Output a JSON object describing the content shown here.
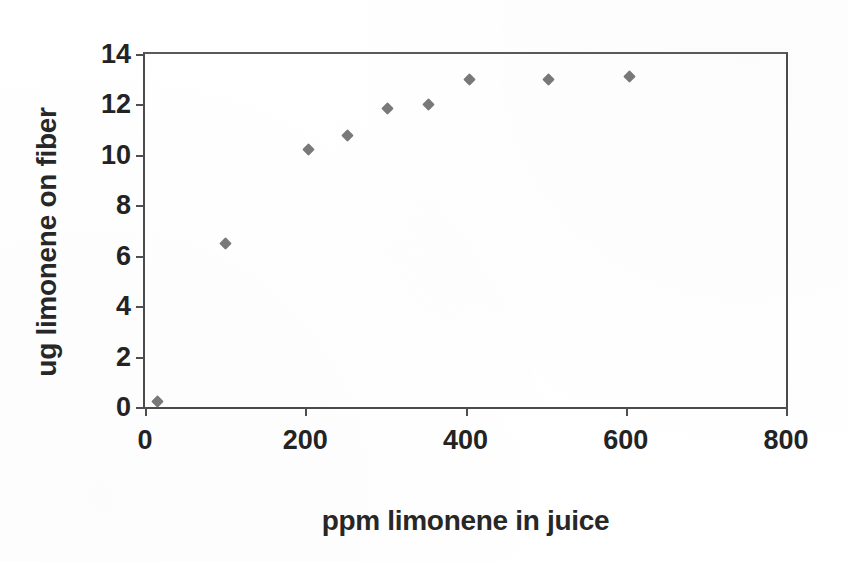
{
  "chart_data": {
    "type": "scatter",
    "title": "",
    "subtitle": "",
    "xlabel": "ppm limonene in juice",
    "ylabel": "ug limonene on fiber",
    "xlim": [
      0,
      800
    ],
    "ylim": [
      0,
      14
    ],
    "xticks": [
      "0",
      "200",
      "400",
      "600",
      "800"
    ],
    "xtick_values": [
      0,
      200,
      400,
      600,
      800
    ],
    "yticks": [
      "0",
      "2",
      "4",
      "6",
      "8",
      "10",
      "12",
      "14"
    ],
    "ytick_values": [
      0,
      2,
      4,
      6,
      8,
      10,
      12,
      14
    ],
    "grid": false,
    "legend": null,
    "legend_position": "none",
    "marker": {
      "shape": "diamond",
      "color": "#6e6e6e",
      "size_px": 9
    },
    "frame": "box",
    "series": [
      {
        "name": "limonene uptake",
        "points": [
          {
            "x": 15,
            "y": 0.2
          },
          {
            "x": 100,
            "y": 6.5
          },
          {
            "x": 204,
            "y": 10.2
          },
          {
            "x": 253,
            "y": 10.75
          },
          {
            "x": 303,
            "y": 11.85
          },
          {
            "x": 354,
            "y": 12.0
          },
          {
            "x": 405,
            "y": 13.0
          },
          {
            "x": 503,
            "y": 13.0
          },
          {
            "x": 605,
            "y": 13.1
          }
        ]
      }
    ],
    "annotations": []
  },
  "axes": {
    "x_title": "ppm limonene in juice",
    "y_title": "ug limonene on fiber"
  },
  "colors": {
    "marker": "#6e6e6e",
    "axis": "#4b4b4b",
    "text": "#232323",
    "background": "#ffffff"
  }
}
